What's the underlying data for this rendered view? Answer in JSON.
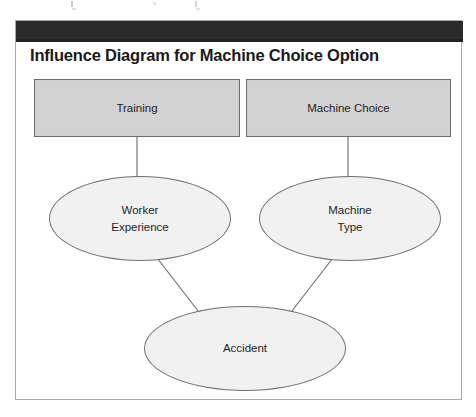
{
  "figure": {
    "title": "Influence Diagram for Machine Choice Option",
    "frame_border_color": "#a8a8a8",
    "header_band_color": "#2b2b2b",
    "page_background": "#ffffff"
  },
  "diagram": {
    "type": "influence-diagram",
    "node_fill_decision": "#d2d2d2",
    "node_fill_chance": "#f1f1f1",
    "node_border_color": "#6d6d6d",
    "edge_color": "#555555",
    "nodes": [
      {
        "id": "training",
        "label": "Training",
        "shape": "rectangle",
        "role": "decision",
        "lines": [
          "Training"
        ]
      },
      {
        "id": "machine_choice",
        "label": "Machine Choice",
        "shape": "rectangle",
        "role": "decision",
        "lines": [
          "Machine Choice"
        ]
      },
      {
        "id": "worker_experience",
        "label": "Worker Experience",
        "shape": "ellipse",
        "role": "chance",
        "lines": [
          "Worker",
          "Experience"
        ]
      },
      {
        "id": "machine_type",
        "label": "Machine Type",
        "shape": "ellipse",
        "role": "chance",
        "lines": [
          "Machine",
          "Type"
        ]
      },
      {
        "id": "accident",
        "label": "Accident",
        "shape": "ellipse",
        "role": "outcome",
        "lines": [
          "Accident"
        ]
      }
    ],
    "edges": [
      {
        "id": "e1",
        "from": "training",
        "to": "worker_experience",
        "style": "straight-vertical"
      },
      {
        "id": "e2",
        "from": "machine_choice",
        "to": "machine_type",
        "style": "straight-vertical"
      },
      {
        "id": "e3",
        "from": "worker_experience",
        "to": "accident",
        "style": "diagonal"
      },
      {
        "id": "e4",
        "from": "machine_type",
        "to": "accident",
        "style": "diagonal"
      }
    ]
  }
}
